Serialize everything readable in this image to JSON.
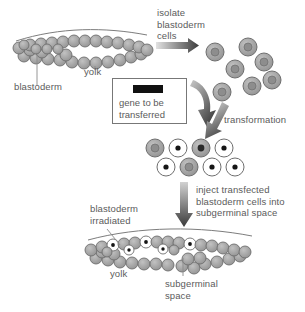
{
  "figure": {
    "background_color": "#ffffff",
    "text_color": "#5b5b5b",
    "cell_fill_gray": "#9a9a9a",
    "cell_fill_white": "#ffffff",
    "cell_stroke": "#6e6e6e",
    "nucleus_color": "#1a1a1a",
    "arrow_dark": "#3a3a3a",
    "arrow_light": "#d8d8d8",
    "gene_bar_color": "#111111"
  },
  "labels": {
    "blastoderm_top": "blastoderm",
    "yolk_top": "yolk",
    "isolate_step": "isolate\nblastoderm\ncells",
    "gene_box_text": "gene to be\ntransferred",
    "transformation": "transformation",
    "inject_step": "inject transfected\nblastoderm cells into\nsubgerminal space",
    "blastoderm_irradiated": "blastoderm\nirradiated",
    "yolk_bottom": "yolk",
    "subgerminal_space": "subgerminal\nspace"
  },
  "steps": [
    {
      "id": "isolate",
      "label": "isolate blastoderm cells",
      "arrow": "right"
    },
    {
      "id": "transform",
      "label": "transformation",
      "arrow": "down-right"
    },
    {
      "id": "inject",
      "label": "inject transfected blastoderm cells into subgerminal space",
      "arrow": "down"
    }
  ],
  "diagram_data": {
    "type": "diagram",
    "top_embryo": {
      "name": "intact blastoderm on yolk",
      "cell_count_upper_row": 17,
      "cell_count_lower_row": 14,
      "cell_state": "untransformed-gray"
    },
    "isolated_cells": {
      "name": "isolated blastoderm cells",
      "count": 7,
      "cell_state": "gray-with-gray-nucleus"
    },
    "transformed_cells": {
      "name": "cells after transformation",
      "count": 8,
      "transformed_count": 5,
      "untransformed_count": 3,
      "transformed_marker": "white cell with black nucleus dot"
    },
    "bottom_embryo": {
      "name": "irradiated blastoderm with injected transfected cells",
      "cell_count_upper_row": 17,
      "cell_count_lower_row": 14,
      "transformed_cells_visible": 5
    }
  }
}
